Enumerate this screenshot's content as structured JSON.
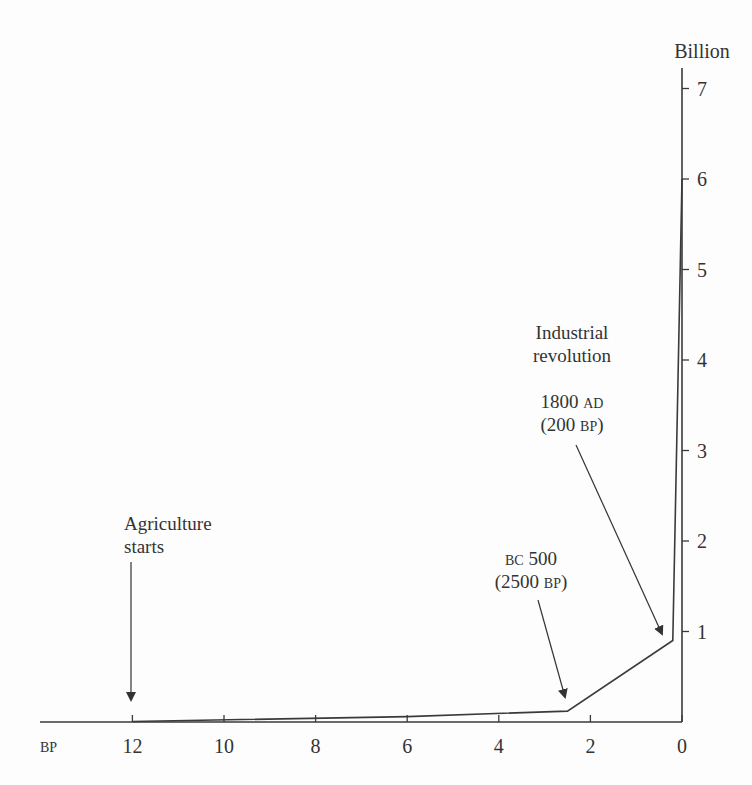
{
  "chart_data": {
    "type": "line",
    "title": "",
    "xlabel": "BP",
    "ylabel": "Billion",
    "x_units": "thousand years before present",
    "xlim": [
      12.5,
      0
    ],
    "ylim": [
      0,
      7.2
    ],
    "x_ticks": [
      12,
      10,
      8,
      6,
      4,
      2,
      0
    ],
    "y_ticks": [
      1,
      2,
      3,
      4,
      5,
      6,
      7
    ],
    "grid": false,
    "legend": null,
    "series": [
      {
        "name": "World population",
        "x": [
          12,
          6,
          2.5,
          0.2,
          0
        ],
        "values": [
          0.005,
          0.06,
          0.12,
          0.9,
          6.0
        ]
      }
    ],
    "annotations": [
      {
        "id": "agriculture",
        "lines": [
          "Agriculture",
          "starts"
        ],
        "points_to": {
          "x": 12,
          "y": 0.005
        }
      },
      {
        "id": "bc500",
        "line1": {
          "sc": "BC",
          "text": " 500"
        },
        "line2": {
          "pre": "(2500 ",
          "sc": "BP",
          "post": ")"
        },
        "points_to": {
          "x": 2.5,
          "y": 0.12
        }
      },
      {
        "id": "industrial",
        "lines": [
          "Industrial",
          "revolution"
        ],
        "line3": {
          "text": "1800 ",
          "sc": "AD"
        },
        "line4": {
          "pre": "(200 ",
          "sc": "BP",
          "post": ")"
        },
        "points_to": {
          "x": 0.2,
          "y": 0.9
        }
      }
    ],
    "colors": {
      "line": "#3a3a3a",
      "axis": "#3a3a3a",
      "text": "#333333"
    }
  },
  "labels": {
    "y_unit": "Billion",
    "x_unit": "BP",
    "ann_agri_1": "Agriculture",
    "ann_agri_2": "starts",
    "ann_bc_sc": "BC",
    "ann_bc_num": " 500",
    "ann_bc_p1": "(2500 ",
    "ann_bc_sc2": "BP",
    "ann_bc_p2": ")",
    "ann_ind_1": "Industrial",
    "ann_ind_2": "revolution",
    "ann_ind_num": "1800 ",
    "ann_ind_sc": "AD",
    "ann_ind_p1": "(200 ",
    "ann_ind_sc2": "BP",
    "ann_ind_p2": ")"
  }
}
